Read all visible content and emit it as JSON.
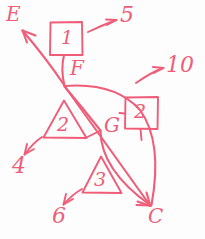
{
  "diagram": {
    "ink_color": "#ef5d78",
    "background_color": "#fdfdfd",
    "vertices": [
      {
        "id": "E",
        "label": "E",
        "x": 14,
        "y": 16
      },
      {
        "id": "F",
        "label": "F",
        "x": 78,
        "y": 70
      },
      {
        "id": "G",
        "label": "G",
        "x": 110,
        "y": 127
      },
      {
        "id": "C",
        "label": "C",
        "x": 155,
        "y": 214
      }
    ],
    "boxes": [
      {
        "id": "box-1",
        "label": "1",
        "x": 50,
        "y": 22,
        "w": 32,
        "h": 33
      },
      {
        "id": "box-2",
        "label": "2",
        "x": 125,
        "y": 97,
        "w": 33,
        "h": 32
      }
    ],
    "triangles": [
      {
        "id": "triangle-2",
        "label": "2",
        "apex_x": 64,
        "apex_y": 101,
        "left_x": 44,
        "right_x": 86,
        "base_y": 138
      },
      {
        "id": "triangle-3",
        "label": "3",
        "apex_x": 101,
        "apex_y": 157,
        "left_x": 83,
        "right_x": 121,
        "base_y": 193
      }
    ],
    "callouts": [
      {
        "id": "callout-5",
        "label": "5",
        "x": 123,
        "y": 13,
        "points_to": "box-1"
      },
      {
        "id": "callout-10",
        "label": "10",
        "x": 168,
        "y": 60,
        "points_to": "box-2"
      },
      {
        "id": "callout-4",
        "label": "4",
        "x": 14,
        "y": 160,
        "points_to": "triangle-2"
      },
      {
        "id": "callout-6",
        "label": "6",
        "x": 54,
        "y": 209,
        "points_to": "triangle-3"
      }
    ],
    "edges": [
      {
        "from": "F",
        "to": "E",
        "kind": "arrow",
        "style": "straight"
      },
      {
        "from": "box-1",
        "to": "F",
        "kind": "line",
        "style": "curved"
      },
      {
        "from": "F",
        "to": "C",
        "kind": "arrow",
        "style": "straight"
      },
      {
        "from": "F",
        "to": "C",
        "kind": "arrow",
        "style": "curved"
      },
      {
        "from": "G",
        "to": "C",
        "kind": "arrow",
        "style": "curved"
      },
      {
        "from": "F",
        "to": "G",
        "kind": "line",
        "style": "curved"
      }
    ]
  }
}
